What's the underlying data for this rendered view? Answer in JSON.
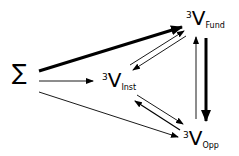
{
  "diagram": {
    "nodes": {
      "sigma": {
        "label": "∑"
      },
      "inst": {
        "sup": "3",
        "main": "V",
        "sub": "Inst"
      },
      "fund": {
        "sup": "3",
        "main": "V",
        "sub": "Fund"
      },
      "opp": {
        "sup": "3",
        "main": "V",
        "sub": "Opp"
      }
    },
    "edges": [
      {
        "from": "sigma",
        "to": "fund",
        "weight": "thick"
      },
      {
        "from": "sigma",
        "to": "inst",
        "weight": "thin"
      },
      {
        "from": "sigma",
        "to": "opp",
        "weight": "thin"
      },
      {
        "from": "inst",
        "to": "fund",
        "weight": "thin"
      },
      {
        "from": "fund",
        "to": "inst",
        "weight": "thin"
      },
      {
        "from": "inst",
        "to": "opp",
        "weight": "thin"
      },
      {
        "from": "opp",
        "to": "inst",
        "weight": "thin"
      },
      {
        "from": "fund",
        "to": "opp",
        "weight": "thick"
      },
      {
        "from": "opp",
        "to": "fund",
        "weight": "thin"
      }
    ],
    "colors": {
      "stroke": "#000000",
      "background": "#ffffff"
    }
  }
}
